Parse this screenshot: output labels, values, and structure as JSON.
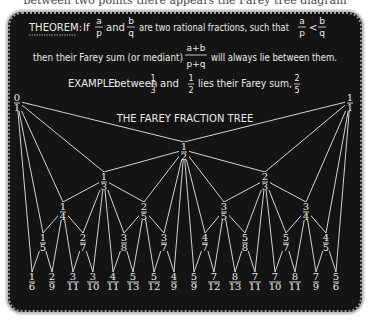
{
  "cut_caption": "between two points there appears the Farey tree diagram",
  "theorem": {
    "label": "THEOREM:",
    "line1_parts": [
      "If",
      "and",
      "are two rational fractions, such that"
    ],
    "line2_before": "then their Farey sum (or mediant)",
    "line2_after": "will always lie between them.",
    "frac_a": {
      "num": "a",
      "den": "p"
    },
    "frac_b": {
      "num": "b",
      "den": "q"
    },
    "mediant": {
      "num": "a+b",
      "den": "p+q"
    },
    "inequality": "<"
  },
  "example": {
    "label": "EXAMPLE:",
    "text_before": "between",
    "text_mid": "and",
    "text_after": "lies their Farey sum,",
    "f1": {
      "num": "1",
      "den": "3"
    },
    "f2": {
      "num": "1",
      "den": "2"
    },
    "result": {
      "num": "2",
      "den": "5"
    }
  },
  "tree": {
    "title": "THE FAREY FRACTION TREE",
    "nodes": [
      {
        "id": "0/1",
        "num": "0",
        "den": "1",
        "x": 17,
        "y": 103
      },
      {
        "id": "1/1",
        "num": "1",
        "den": "1",
        "x": 350,
        "y": 103
      },
      {
        "id": "1/2",
        "num": "1",
        "den": "2",
        "x": 184,
        "y": 152
      },
      {
        "id": "1/3",
        "num": "1",
        "den": "3",
        "x": 104,
        "y": 182
      },
      {
        "id": "2/3",
        "num": "2",
        "den": "3",
        "x": 265,
        "y": 182
      },
      {
        "id": "1/4",
        "num": "1",
        "den": "4",
        "x": 63,
        "y": 212
      },
      {
        "id": "2/5",
        "num": "2",
        "den": "5",
        "x": 144,
        "y": 212
      },
      {
        "id": "3/5",
        "num": "3",
        "den": "5",
        "x": 224,
        "y": 212
      },
      {
        "id": "3/4",
        "num": "3",
        "den": "4",
        "x": 306,
        "y": 212
      },
      {
        "id": "1/5",
        "num": "1",
        "den": "5",
        "x": 43,
        "y": 243
      },
      {
        "id": "2/7",
        "num": "2",
        "den": "7",
        "x": 83,
        "y": 243
      },
      {
        "id": "3/8",
        "num": "3",
        "den": "8",
        "x": 124,
        "y": 243
      },
      {
        "id": "3/7",
        "num": "3",
        "den": "7",
        "x": 164,
        "y": 243
      },
      {
        "id": "4/7",
        "num": "4",
        "den": "7",
        "x": 205,
        "y": 243
      },
      {
        "id": "5/8",
        "num": "5",
        "den": "8",
        "x": 245,
        "y": 243
      },
      {
        "id": "5/7",
        "num": "5",
        "den": "7",
        "x": 286,
        "y": 243
      },
      {
        "id": "4/5",
        "num": "4",
        "den": "5",
        "x": 326,
        "y": 243
      },
      {
        "id": "1/6",
        "num": "1",
        "den": "6",
        "x": 32,
        "y": 282
      },
      {
        "id": "2/9",
        "num": "2",
        "den": "9",
        "x": 52,
        "y": 282
      },
      {
        "id": "3/11",
        "num": "3",
        "den": "11",
        "x": 73,
        "y": 282
      },
      {
        "id": "3/10",
        "num": "3",
        "den": "10",
        "x": 93,
        "y": 282
      },
      {
        "id": "4/11",
        "num": "4",
        "den": "11",
        "x": 113,
        "y": 282
      },
      {
        "id": "5/13",
        "num": "5",
        "den": "13",
        "x": 133,
        "y": 282
      },
      {
        "id": "5/12",
        "num": "5",
        "den": "12",
        "x": 154,
        "y": 282
      },
      {
        "id": "4/9",
        "num": "4",
        "den": "9",
        "x": 174,
        "y": 282
      },
      {
        "id": "5/9",
        "num": "5",
        "den": "9",
        "x": 194,
        "y": 282
      },
      {
        "id": "7/12",
        "num": "7",
        "den": "12",
        "x": 214,
        "y": 282
      },
      {
        "id": "8/13",
        "num": "8",
        "den": "13",
        "x": 235,
        "y": 282
      },
      {
        "id": "7/11",
        "num": "7",
        "den": "11",
        "x": 255,
        "y": 282
      },
      {
        "id": "7/10",
        "num": "7",
        "den": "10",
        "x": 275,
        "y": 282
      },
      {
        "id": "8/11",
        "num": "8",
        "den": "11",
        "x": 295,
        "y": 282
      },
      {
        "id": "7/9",
        "num": "7",
        "den": "9",
        "x": 316,
        "y": 282
      },
      {
        "id": "5/6",
        "num": "5",
        "den": "6",
        "x": 336,
        "y": 282
      }
    ],
    "edges": [
      [
        "0/1",
        "1/2"
      ],
      [
        "1/1",
        "1/2"
      ],
      [
        "0/1",
        "1/3"
      ],
      [
        "1/2",
        "1/3"
      ],
      [
        "1/2",
        "2/3"
      ],
      [
        "1/1",
        "2/3"
      ],
      [
        "0/1",
        "1/4"
      ],
      [
        "1/3",
        "1/4"
      ],
      [
        "1/3",
        "2/5"
      ],
      [
        "1/2",
        "2/5"
      ],
      [
        "1/2",
        "3/5"
      ],
      [
        "2/3",
        "3/5"
      ],
      [
        "2/3",
        "3/4"
      ],
      [
        "1/1",
        "3/4"
      ],
      [
        "0/1",
        "1/5"
      ],
      [
        "1/4",
        "1/5"
      ],
      [
        "1/4",
        "2/7"
      ],
      [
        "1/3",
        "2/7"
      ],
      [
        "1/3",
        "3/8"
      ],
      [
        "2/5",
        "3/8"
      ],
      [
        "2/5",
        "3/7"
      ],
      [
        "1/2",
        "3/7"
      ],
      [
        "1/2",
        "4/7"
      ],
      [
        "3/5",
        "4/7"
      ],
      [
        "3/5",
        "5/8"
      ],
      [
        "2/3",
        "5/8"
      ],
      [
        "2/3",
        "5/7"
      ],
      [
        "3/4",
        "5/7"
      ],
      [
        "3/4",
        "4/5"
      ],
      [
        "1/1",
        "4/5"
      ],
      [
        "0/1",
        "1/6"
      ],
      [
        "1/5",
        "1/6"
      ],
      [
        "1/5",
        "2/9"
      ],
      [
        "1/4",
        "2/9"
      ],
      [
        "1/4",
        "3/11"
      ],
      [
        "2/7",
        "3/11"
      ],
      [
        "2/7",
        "3/10"
      ],
      [
        "1/3",
        "3/10"
      ],
      [
        "1/3",
        "4/11"
      ],
      [
        "3/8",
        "4/11"
      ],
      [
        "3/8",
        "5/13"
      ],
      [
        "2/5",
        "5/13"
      ],
      [
        "2/5",
        "5/12"
      ],
      [
        "3/7",
        "5/12"
      ],
      [
        "3/7",
        "4/9"
      ],
      [
        "1/2",
        "4/9"
      ],
      [
        "1/2",
        "5/9"
      ],
      [
        "4/7",
        "5/9"
      ],
      [
        "4/7",
        "7/12"
      ],
      [
        "3/5",
        "7/12"
      ],
      [
        "3/5",
        "8/13"
      ],
      [
        "5/8",
        "8/13"
      ],
      [
        "5/8",
        "7/11"
      ],
      [
        "2/3",
        "7/11"
      ],
      [
        "2/3",
        "7/10"
      ],
      [
        "5/7",
        "7/10"
      ],
      [
        "5/7",
        "8/11"
      ],
      [
        "3/4",
        "8/11"
      ],
      [
        "3/4",
        "7/9"
      ],
      [
        "4/5",
        "7/9"
      ],
      [
        "4/5",
        "5/6"
      ],
      [
        "1/1",
        "5/6"
      ]
    ]
  },
  "colors": {
    "board": "#141414",
    "chalk": "#eaeaea",
    "border": "#bdbdbd"
  }
}
